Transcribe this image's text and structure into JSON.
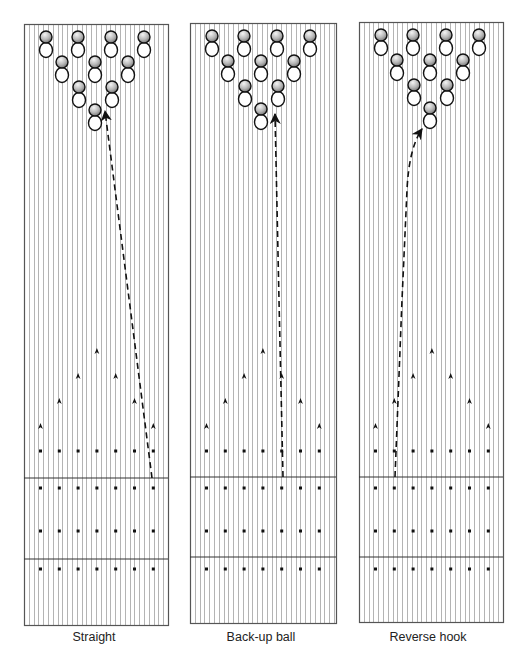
{
  "figure": {
    "colors": {
      "background": "#ffffff",
      "board_stripe": "#b4b4b4",
      "lane_border": "#555555",
      "ink": "#111111",
      "pin_head_light": "#f2f2f2",
      "pin_head_dark": "#7a7a7a"
    },
    "board_spacing_px": 4.8
  },
  "pin_layout": {
    "rows_rel_y": [
      13,
      38,
      63,
      86
    ],
    "rows_rel_x": [
      [
        22,
        54,
        87,
        120
      ],
      [
        38,
        71,
        104
      ],
      [
        55,
        88
      ],
      [
        71
      ]
    ],
    "head_radius": 6,
    "body_offset": 13,
    "body_rx": 6.5,
    "body_ry": 7.5
  },
  "markers": {
    "first_rel_x": 16.5,
    "step_x": 18.8,
    "arrow_rows": [
      {
        "y": 351,
        "indices": [
          3
        ]
      },
      {
        "y": 376,
        "indices": [
          2,
          4
        ]
      },
      {
        "y": 401,
        "indices": [
          1,
          5
        ]
      },
      {
        "y": 426,
        "indices": [
          0,
          6
        ]
      }
    ],
    "dot_rows_y": [
      451,
      488,
      531,
      569
    ],
    "dots_per_row": 7
  },
  "lanes": [
    {
      "label": "Straight",
      "label_x": 94,
      "x": 24,
      "y": 24,
      "w": 144,
      "h": 601,
      "foul_line_y": 478,
      "approach_line_y": 559,
      "ball_path": {
        "type": "straight",
        "d": "M 152 478 L 105 111"
      }
    },
    {
      "label": "Back-up ball",
      "label_x": 261,
      "x": 190,
      "y": 23,
      "w": 146,
      "h": 600,
      "foul_line_y": 477,
      "approach_line_y": 557,
      "ball_path": {
        "type": "back-up",
        "d": "M 283 477 L 279 300 L 275 114"
      }
    },
    {
      "label": "Reverse hook",
      "label_x": 428,
      "x": 359,
      "y": 22,
      "w": 144,
      "h": 600,
      "foul_line_y": 477,
      "approach_line_y": 557,
      "ball_path": {
        "type": "reverse-hook",
        "d": "M 395 477 L 402 300 L 407 190 Q 409 148 422 129"
      }
    }
  ]
}
